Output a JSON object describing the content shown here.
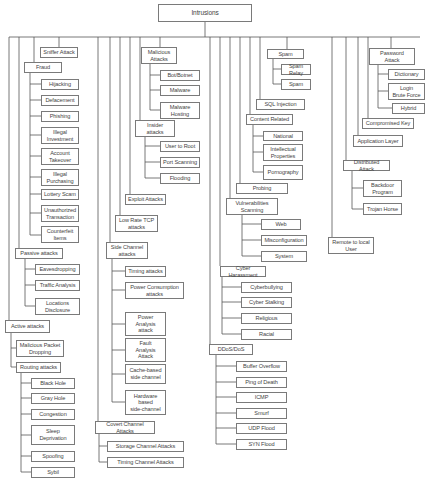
{
  "diagram": {
    "title": "Intrusions",
    "colors": {
      "line": "#555555",
      "box_border": "#7a7a7a",
      "text": "#444444",
      "background": "#ffffff"
    },
    "nodes": [
      {
        "id": "root",
        "label": "Intrusions",
        "x": 158,
        "y": 4,
        "w": 94,
        "h": 18
      },
      {
        "id": "sniffer",
        "label": "Sniffer Attack",
        "x": 40,
        "y": 47,
        "w": 38,
        "h": 11
      },
      {
        "id": "fraud",
        "label": "Fraud",
        "x": 24,
        "y": 62,
        "w": 38,
        "h": 11
      },
      {
        "id": "hijacking",
        "label": "Hijacking",
        "x": 41,
        "y": 79,
        "w": 38,
        "h": 11
      },
      {
        "id": "defacement",
        "label": "Defacement",
        "x": 41,
        "y": 95,
        "w": 38,
        "h": 11
      },
      {
        "id": "phishing",
        "label": "Phishing",
        "x": 41,
        "y": 111,
        "w": 38,
        "h": 11
      },
      {
        "id": "illegal_investment",
        "label": "Illegal\nInvestment",
        "x": 41,
        "y": 127,
        "w": 38,
        "h": 17
      },
      {
        "id": "account_takeover",
        "label": "Account\nTakeover",
        "x": 41,
        "y": 148,
        "w": 38,
        "h": 17
      },
      {
        "id": "illegal_purchasing",
        "label": "Illegal\nPurchasing",
        "x": 41,
        "y": 169,
        "w": 38,
        "h": 17
      },
      {
        "id": "lottery_scam",
        "label": "Lottery Scam",
        "x": 41,
        "y": 189,
        "w": 38,
        "h": 11
      },
      {
        "id": "unauthorized",
        "label": "Unauthorized\nTransaction",
        "x": 41,
        "y": 205,
        "w": 38,
        "h": 17
      },
      {
        "id": "counterfeit",
        "label": "Counterfeit\nItems",
        "x": 41,
        "y": 226,
        "w": 38,
        "h": 17
      },
      {
        "id": "passive",
        "label": "Passive attacks",
        "x": 15,
        "y": 248,
        "w": 48,
        "h": 11
      },
      {
        "id": "eavesdropping",
        "label": "Eavesdropping",
        "x": 35,
        "y": 264,
        "w": 45,
        "h": 11
      },
      {
        "id": "traffic",
        "label": "Traffic Analysis",
        "x": 35,
        "y": 280,
        "w": 45,
        "h": 11
      },
      {
        "id": "locations",
        "label": "Locations\nDisclosure",
        "x": 35,
        "y": 298,
        "w": 45,
        "h": 17
      },
      {
        "id": "active",
        "label": "Active attacks",
        "x": 5,
        "y": 320,
        "w": 45,
        "h": 13
      },
      {
        "id": "malicious_packet",
        "label": "Malicious Packet\nDropping",
        "x": 16,
        "y": 340,
        "w": 48,
        "h": 17
      },
      {
        "id": "routing",
        "label": "Routing attacks",
        "x": 16,
        "y": 362,
        "w": 45,
        "h": 11
      },
      {
        "id": "black_hole",
        "label": "Black Hole",
        "x": 31,
        "y": 378,
        "w": 44,
        "h": 11
      },
      {
        "id": "gray_hole",
        "label": "Gray Hole",
        "x": 31,
        "y": 393,
        "w": 44,
        "h": 11
      },
      {
        "id": "congestion",
        "label": "Congestion",
        "x": 31,
        "y": 409,
        "w": 44,
        "h": 11
      },
      {
        "id": "sleep",
        "label": "Sleep\nDeprivation",
        "x": 31,
        "y": 425,
        "w": 44,
        "h": 20
      },
      {
        "id": "spoofing",
        "label": "Spoofing",
        "x": 31,
        "y": 451,
        "w": 44,
        "h": 11
      },
      {
        "id": "sybil",
        "label": "Sybil",
        "x": 31,
        "y": 467,
        "w": 44,
        "h": 11
      },
      {
        "id": "malicious_attacks",
        "label": "Malicious\nAttacks",
        "x": 141,
        "y": 47,
        "w": 36,
        "h": 17
      },
      {
        "id": "botnet",
        "label": "Bot/Botnet",
        "x": 160,
        "y": 70,
        "w": 40,
        "h": 11
      },
      {
        "id": "malware",
        "label": "Malware",
        "x": 160,
        "y": 85,
        "w": 40,
        "h": 11
      },
      {
        "id": "malware_hosting",
        "label": "Malware\nHosting",
        "x": 160,
        "y": 102,
        "w": 40,
        "h": 17
      },
      {
        "id": "insider",
        "label": "Insider\nattacks",
        "x": 135,
        "y": 120,
        "w": 40,
        "h": 17
      },
      {
        "id": "user_to_root",
        "label": "User to Root",
        "x": 160,
        "y": 141,
        "w": 40,
        "h": 11
      },
      {
        "id": "port_scanning",
        "label": "Port Scanning",
        "x": 160,
        "y": 157,
        "w": 40,
        "h": 11
      },
      {
        "id": "flooding",
        "label": "Flooding",
        "x": 160,
        "y": 173,
        "w": 40,
        "h": 11
      },
      {
        "id": "exploit",
        "label": "Exploit Attacks",
        "x": 125,
        "y": 194,
        "w": 41,
        "h": 11
      },
      {
        "id": "low_rate_tcp",
        "label": "Low Rate TCP\nattacks",
        "x": 115,
        "y": 215,
        "w": 43,
        "h": 17
      },
      {
        "id": "side_channel",
        "label": "Side Channel\nattacks",
        "x": 106,
        "y": 242,
        "w": 42,
        "h": 17
      },
      {
        "id": "timing_attacks",
        "label": "Timing attacks",
        "x": 125,
        "y": 266,
        "w": 41,
        "h": 11
      },
      {
        "id": "power_consumption",
        "label": "Power Consumption\nattacks",
        "x": 125,
        "y": 282,
        "w": 59,
        "h": 17
      },
      {
        "id": "power_analysis",
        "label": "Power\nAnalysis\nattack",
        "x": 125,
        "y": 312,
        "w": 41,
        "h": 24
      },
      {
        "id": "fault_analysis",
        "label": "Fault\nAnalysis\nAttack",
        "x": 125,
        "y": 338,
        "w": 41,
        "h": 24
      },
      {
        "id": "cache_based",
        "label": "Cache-based\nside channel",
        "x": 125,
        "y": 364,
        "w": 41,
        "h": 20
      },
      {
        "id": "hardware_based",
        "label": "Hardware\nbased\nside-channel",
        "x": 125,
        "y": 390,
        "w": 41,
        "h": 25
      },
      {
        "id": "covert",
        "label": "Covert Channel Attacks",
        "x": 95,
        "y": 421,
        "w": 60,
        "h": 13
      },
      {
        "id": "storage_channel",
        "label": "Storage Channel Attacks",
        "x": 107,
        "y": 441,
        "w": 77,
        "h": 11
      },
      {
        "id": "timing_channel",
        "label": "Timing Channel Attacks",
        "x": 107,
        "y": 457,
        "w": 77,
        "h": 11
      },
      {
        "id": "spam",
        "label": "Spam",
        "x": 267,
        "y": 49,
        "w": 37,
        "h": 10
      },
      {
        "id": "spam_relay",
        "label": "Spam Relay",
        "x": 281,
        "y": 64,
        "w": 30,
        "h": 11
      },
      {
        "id": "spam_child",
        "label": "Spam",
        "x": 281,
        "y": 79,
        "w": 30,
        "h": 11
      },
      {
        "id": "sql_injection",
        "label": "SQL Injection",
        "x": 256,
        "y": 99,
        "w": 49,
        "h": 11
      },
      {
        "id": "content_related",
        "label": "Content Related",
        "x": 246,
        "y": 114,
        "w": 47,
        "h": 11
      },
      {
        "id": "national",
        "label": "National",
        "x": 263,
        "y": 131,
        "w": 40,
        "h": 10
      },
      {
        "id": "intellectual",
        "label": "Intellectual\nProperties",
        "x": 263,
        "y": 144,
        "w": 40,
        "h": 17
      },
      {
        "id": "pornography",
        "label": "Pornography",
        "x": 263,
        "y": 165,
        "w": 40,
        "h": 15
      },
      {
        "id": "probing",
        "label": "Probing",
        "x": 236,
        "y": 183,
        "w": 52,
        "h": 11
      },
      {
        "id": "vulnerabilities",
        "label": "Vulnerabilities\nScanning",
        "x": 226,
        "y": 198,
        "w": 52,
        "h": 17
      },
      {
        "id": "web",
        "label": "Web",
        "x": 261,
        "y": 219,
        "w": 40,
        "h": 11
      },
      {
        "id": "misconfiguration",
        "label": "Misconfiguration",
        "x": 261,
        "y": 235,
        "w": 46,
        "h": 11
      },
      {
        "id": "system",
        "label": "System",
        "x": 261,
        "y": 251,
        "w": 46,
        "h": 11
      },
      {
        "id": "cyber_harassment",
        "label": "Cyber Harassment",
        "x": 220,
        "y": 266,
        "w": 46,
        "h": 11
      },
      {
        "id": "cyberbullying",
        "label": "Cyberbullying",
        "x": 241,
        "y": 282,
        "w": 51,
        "h": 11
      },
      {
        "id": "cyber_stalking",
        "label": "Cyber Stalking",
        "x": 241,
        "y": 297,
        "w": 51,
        "h": 11
      },
      {
        "id": "religious",
        "label": "Religious",
        "x": 241,
        "y": 313,
        "w": 51,
        "h": 11
      },
      {
        "id": "racial",
        "label": "Racial",
        "x": 241,
        "y": 329,
        "w": 51,
        "h": 11
      },
      {
        "id": "ddos",
        "label": "DDoS/DoS",
        "x": 209,
        "y": 344,
        "w": 44,
        "h": 11
      },
      {
        "id": "buffer_overflow",
        "label": "Buffer Overflow",
        "x": 236,
        "y": 361,
        "w": 51,
        "h": 11
      },
      {
        "id": "ping_of_death",
        "label": "Ping of Death",
        "x": 236,
        "y": 377,
        "w": 51,
        "h": 11
      },
      {
        "id": "icmp",
        "label": "ICMP",
        "x": 236,
        "y": 392,
        "w": 51,
        "h": 11
      },
      {
        "id": "smurf",
        "label": "Smurf",
        "x": 236,
        "y": 408,
        "w": 51,
        "h": 11
      },
      {
        "id": "udp_flood",
        "label": "UDP Flood",
        "x": 236,
        "y": 423,
        "w": 51,
        "h": 11
      },
      {
        "id": "syn_flood",
        "label": "SYN Flood",
        "x": 236,
        "y": 439,
        "w": 51,
        "h": 11
      },
      {
        "id": "password",
        "label": "Password\nAttack",
        "x": 369,
        "y": 48,
        "w": 46,
        "h": 17
      },
      {
        "id": "dictionary",
        "label": "Dictionary",
        "x": 388,
        "y": 69,
        "w": 37,
        "h": 11
      },
      {
        "id": "login_brute",
        "label": "Login\nBrute Force",
        "x": 388,
        "y": 83,
        "w": 37,
        "h": 17
      },
      {
        "id": "hybrid",
        "label": "Hybrid",
        "x": 392,
        "y": 103,
        "w": 33,
        "h": 11
      },
      {
        "id": "compromised_key",
        "label": "Compromised Key",
        "x": 362,
        "y": 118,
        "w": 52,
        "h": 11
      },
      {
        "id": "application_layer",
        "label": "Application Layer",
        "x": 353,
        "y": 135,
        "w": 50,
        "h": 12
      },
      {
        "id": "distributed",
        "label": "Distributed Attack",
        "x": 343,
        "y": 160,
        "w": 47,
        "h": 11
      },
      {
        "id": "backdoor",
        "label": "Backdoor\nProgram",
        "x": 363,
        "y": 180,
        "w": 39,
        "h": 17
      },
      {
        "id": "trojan",
        "label": "Trojan Horse",
        "x": 363,
        "y": 203,
        "w": 39,
        "h": 12
      },
      {
        "id": "remote_to_local",
        "label": "Remote to local\nUser",
        "x": 328,
        "y": 237,
        "w": 46,
        "h": 17
      }
    ]
  }
}
